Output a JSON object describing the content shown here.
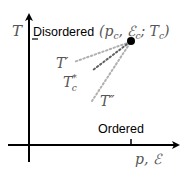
{
  "diagram": {
    "y_axis_label": "T",
    "x_axis_label": "p, ℰ",
    "region_labels": {
      "upper": "Disordered",
      "lower": "Ordered"
    },
    "critical_point_label": "(p",
    "critical_point_label_parts": {
      "open": "(",
      "p": "p",
      "p_sub": "c",
      "sep1": ", ",
      "e": "ℰ",
      "e_sub": "c",
      "sep2": "; ",
      "t": "T",
      "t_sub": "c",
      "close": ")"
    },
    "curve_labels": [
      {
        "id": "t-prime",
        "text": "T′"
      },
      {
        "id": "t-c-star",
        "text": "T",
        "sup": "*",
        "sub": "c"
      },
      {
        "id": "t-double-prime",
        "text": "T″"
      }
    ],
    "colors": {
      "axis": "#000000",
      "dotted_light": "#b0b0b0",
      "dotted_dark": "#606060",
      "point": "#000000",
      "math_text": "#555555"
    }
  }
}
